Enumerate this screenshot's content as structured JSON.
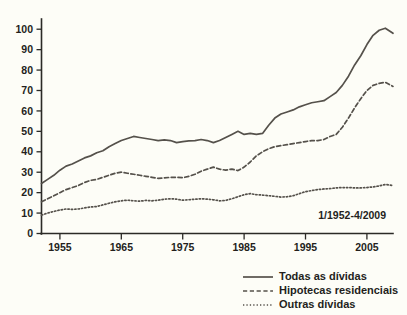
{
  "chart_data": {
    "type": "line",
    "title": "",
    "subtitle": "",
    "xlabel": "",
    "ylabel": "",
    "annotation": "1/1952-4/2009",
    "grid": false,
    "legend_position": "bottom-right",
    "xlim": [
      1952,
      2009.25
    ],
    "ylim": [
      0,
      105
    ],
    "ytick_labels": [
      "0",
      "10",
      "20",
      "30",
      "40",
      "50",
      "60",
      "70",
      "80",
      "90",
      "100"
    ],
    "ytick_values": [
      0,
      10,
      20,
      30,
      40,
      50,
      60,
      70,
      80,
      90,
      100
    ],
    "xtick_labels": [
      "1955",
      "1965",
      "1975",
      "1985",
      "1995",
      "2005"
    ],
    "xtick_values": [
      1955,
      1965,
      1975,
      1985,
      1995,
      2005
    ],
    "line_color": "#55514b",
    "axis_color": "#2b2a26",
    "background_color": "#fdfdf7",
    "x": [
      1952,
      1953,
      1954,
      1955,
      1956,
      1957,
      1958,
      1959,
      1960,
      1961,
      1962,
      1963,
      1964,
      1965,
      1966,
      1967,
      1968,
      1969,
      1970,
      1971,
      1972,
      1973,
      1974,
      1975,
      1976,
      1977,
      1978,
      1979,
      1980,
      1981,
      1982,
      1983,
      1984,
      1985,
      1986,
      1987,
      1988,
      1989,
      1990,
      1991,
      1992,
      1993,
      1994,
      1995,
      1996,
      1997,
      1998,
      1999,
      2000,
      2001,
      2002,
      2003,
      2004,
      2005,
      2006,
      2007,
      2008,
      2009.25
    ],
    "series": [
      {
        "name": "Todas as dívidas",
        "style": "solid",
        "values": [
          24.5,
          26.5,
          28.5,
          31.0,
          33.0,
          34.0,
          35.5,
          37.0,
          38.0,
          39.5,
          40.5,
          42.5,
          44.0,
          45.5,
          46.5,
          47.5,
          47.0,
          46.5,
          46.0,
          45.5,
          45.8,
          45.5,
          44.5,
          45.0,
          45.3,
          45.5,
          46.0,
          45.5,
          44.5,
          45.5,
          47.0,
          48.5,
          50.0,
          48.5,
          49.0,
          48.5,
          49.0,
          53.0,
          56.5,
          58.5,
          59.5,
          60.5,
          62.0,
          63.0,
          64.0,
          64.5,
          65.0,
          67.0,
          69.0,
          72.5,
          77.0,
          82.5,
          87.0,
          92.5,
          97.0,
          99.5,
          100.5,
          98.0
        ]
      },
      {
        "name": "Hipotecas residenciais",
        "style": "dashed",
        "values": [
          15.5,
          17.0,
          18.5,
          20.0,
          21.5,
          22.5,
          23.5,
          25.0,
          26.0,
          26.5,
          27.5,
          28.5,
          29.5,
          30.0,
          29.5,
          29.0,
          28.5,
          28.0,
          27.5,
          27.0,
          27.2,
          27.5,
          27.5,
          27.3,
          28.0,
          29.0,
          30.5,
          31.5,
          32.5,
          31.5,
          31.0,
          31.5,
          30.8,
          32.5,
          35.0,
          38.0,
          40.0,
          41.5,
          42.5,
          43.0,
          43.5,
          44.0,
          44.5,
          45.0,
          45.5,
          45.5,
          46.0,
          47.5,
          48.5,
          52.0,
          56.5,
          61.5,
          66.0,
          70.0,
          72.5,
          73.5,
          74.0,
          72.0
        ]
      },
      {
        "name": "Outras dívidas",
        "style": "dotted",
        "values": [
          9.0,
          10.0,
          10.8,
          11.5,
          12.0,
          11.8,
          12.0,
          12.5,
          13.0,
          13.2,
          14.0,
          14.8,
          15.5,
          16.0,
          16.3,
          16.0,
          15.8,
          16.2,
          16.0,
          16.3,
          16.8,
          17.0,
          16.8,
          16.3,
          16.5,
          16.8,
          17.0,
          16.8,
          16.5,
          16.0,
          16.2,
          17.0,
          18.0,
          19.0,
          19.5,
          19.0,
          18.8,
          18.5,
          18.2,
          17.8,
          18.0,
          18.5,
          19.5,
          20.5,
          21.0,
          21.5,
          21.8,
          22.0,
          22.3,
          22.5,
          22.5,
          22.3,
          22.3,
          22.5,
          22.8,
          23.3,
          24.0,
          23.5
        ]
      }
    ]
  },
  "legend": {
    "items": [
      {
        "label": "Todas as dívidas",
        "style": "solid"
      },
      {
        "label": "Hipotecas residenciais",
        "style": "dashed"
      },
      {
        "label": "Outras dívidas",
        "style": "dotted"
      }
    ]
  }
}
